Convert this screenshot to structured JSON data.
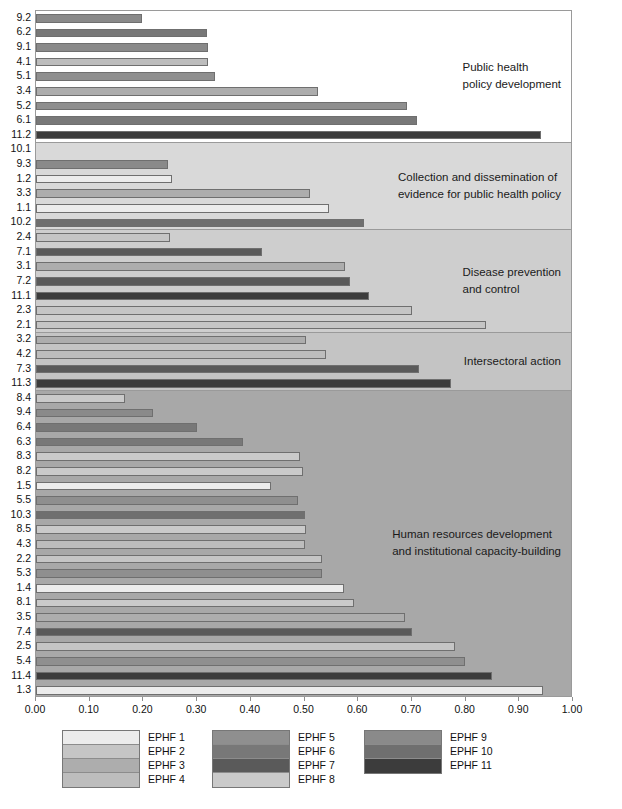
{
  "chart_data": {
    "type": "bar",
    "orientation": "horizontal",
    "title": "",
    "xlabel": "",
    "ylabel": "",
    "xlim": [
      0.0,
      1.0
    ],
    "xticks": [
      "0.00",
      "0.10",
      "0.20",
      "0.30",
      "0.40",
      "0.50",
      "0.60",
      "0.70",
      "0.80",
      "0.90",
      "1.00"
    ],
    "grid": false,
    "legend_position": "bottom",
    "sections": [
      {
        "label": "Public health\npolicy development",
        "background": "#ffffff",
        "bars": [
          {
            "category": "9.2",
            "value": 0.197,
            "series": "EPHF 9"
          },
          {
            "category": "6.2",
            "value": 0.318,
            "series": "EPHF 6"
          },
          {
            "category": "9.1",
            "value": 0.321,
            "series": "EPHF 9"
          },
          {
            "category": "4.1",
            "value": 0.32,
            "series": "EPHF 4"
          },
          {
            "category": "5.1",
            "value": 0.333,
            "series": "EPHF 5"
          },
          {
            "category": "3.4",
            "value": 0.525,
            "series": "EPHF 3"
          },
          {
            "category": "5.2",
            "value": 0.69,
            "series": "EPHF 5"
          },
          {
            "category": "6.1",
            "value": 0.71,
            "series": "EPHF 6"
          },
          {
            "category": "11.2",
            "value": 0.94,
            "series": "EPHF 11"
          }
        ]
      },
      {
        "label": "Collection and dissemination of\nevidence for public health policy",
        "background": "#d9d9d9",
        "bars": [
          {
            "category": "10.1",
            "value": 0.0,
            "series": "EPHF 10"
          },
          {
            "category": "9.3",
            "value": 0.245,
            "series": "EPHF 9"
          },
          {
            "category": "1.2",
            "value": 0.253,
            "series": "EPHF 1"
          },
          {
            "category": "3.3",
            "value": 0.51,
            "series": "EPHF 3"
          },
          {
            "category": "1.1",
            "value": 0.545,
            "series": "EPHF 1"
          },
          {
            "category": "10.2",
            "value": 0.61,
            "series": "EPHF 10"
          }
        ]
      },
      {
        "label": "Disease prevention\nand control",
        "background": "#cecece",
        "bars": [
          {
            "category": "2.4",
            "value": 0.25,
            "series": "EPHF 2"
          },
          {
            "category": "7.1",
            "value": 0.42,
            "series": "EPHF 7"
          },
          {
            "category": "3.1",
            "value": 0.575,
            "series": "EPHF 3"
          },
          {
            "category": "7.2",
            "value": 0.585,
            "series": "EPHF 7"
          },
          {
            "category": "11.1",
            "value": 0.62,
            "series": "EPHF 11"
          },
          {
            "category": "2.3",
            "value": 0.7,
            "series": "EPHF 2"
          },
          {
            "category": "2.1",
            "value": 0.838,
            "series": "EPHF 2"
          }
        ]
      },
      {
        "label": "Intersectoral action",
        "background": "#c4c4c4",
        "bars": [
          {
            "category": "3.2",
            "value": 0.503,
            "series": "EPHF 3"
          },
          {
            "category": "4.2",
            "value": 0.54,
            "series": "EPHF 4"
          },
          {
            "category": "7.3",
            "value": 0.713,
            "series": "EPHF 7"
          },
          {
            "category": "11.3",
            "value": 0.772,
            "series": "EPHF 11"
          }
        ]
      },
      {
        "label": "Human resources development\nand institutional capacity-building",
        "background": "#a8a8a8",
        "bars": [
          {
            "category": "8.4",
            "value": 0.165,
            "series": "EPHF 8"
          },
          {
            "category": "9.4",
            "value": 0.218,
            "series": "EPHF 9"
          },
          {
            "category": "6.4",
            "value": 0.3,
            "series": "EPHF 6"
          },
          {
            "category": "6.3",
            "value": 0.385,
            "series": "EPHF 6"
          },
          {
            "category": "8.3",
            "value": 0.492,
            "series": "EPHF 8"
          },
          {
            "category": "8.2",
            "value": 0.497,
            "series": "EPHF 8"
          },
          {
            "category": "1.5",
            "value": 0.438,
            "series": "EPHF 1"
          },
          {
            "category": "5.5",
            "value": 0.488,
            "series": "EPHF 5"
          },
          {
            "category": "10.3",
            "value": 0.5,
            "series": "EPHF 10"
          },
          {
            "category": "8.5",
            "value": 0.502,
            "series": "EPHF 8"
          },
          {
            "category": "4.3",
            "value": 0.5,
            "series": "EPHF 4"
          },
          {
            "category": "2.2",
            "value": 0.532,
            "series": "EPHF 2"
          },
          {
            "category": "5.3",
            "value": 0.533,
            "series": "EPHF 5"
          },
          {
            "category": "1.4",
            "value": 0.573,
            "series": "EPHF 1"
          },
          {
            "category": "8.1",
            "value": 0.593,
            "series": "EPHF 8"
          },
          {
            "category": "3.5",
            "value": 0.688,
            "series": "EPHF 3"
          },
          {
            "category": "7.4",
            "value": 0.7,
            "series": "EPHF 7"
          },
          {
            "category": "2.5",
            "value": 0.78,
            "series": "EPHF 2"
          },
          {
            "category": "5.4",
            "value": 0.798,
            "series": "EPHF 5"
          },
          {
            "category": "11.4",
            "value": 0.85,
            "series": "EPHF 11"
          },
          {
            "category": "1.3",
            "value": 0.945,
            "series": "EPHF 1"
          }
        ]
      }
    ],
    "legend": [
      {
        "label": "EPHF 1",
        "color": "#ececec"
      },
      {
        "label": "EPHF 2",
        "color": "#c5c5c5"
      },
      {
        "label": "EPHF 3",
        "color": "#adadad"
      },
      {
        "label": "EPHF 4",
        "color": "#bdbdbd"
      },
      {
        "label": "EPHF 5",
        "color": "#8f8f8f"
      },
      {
        "label": "EPHF 6",
        "color": "#787878"
      },
      {
        "label": "EPHF 7",
        "color": "#5a5a5a"
      },
      {
        "label": "EPHF 8",
        "color": "#cacaca"
      },
      {
        "label": "EPHF 9",
        "color": "#8a8a8a"
      },
      {
        "label": "EPHF 10",
        "color": "#6f6f6f"
      },
      {
        "label": "EPHF 11",
        "color": "#3c3c3c"
      }
    ],
    "legend_columns": [
      {
        "items": [
          "EPHF 1",
          "EPHF 2",
          "EPHF 3",
          "EPHF 4"
        ]
      },
      {
        "items": [
          "EPHF 5",
          "EPHF 6",
          "EPHF 7",
          "EPHF 8"
        ]
      },
      {
        "items": [
          "EPHF 9",
          "EPHF 10",
          "EPHF 11"
        ]
      }
    ]
  }
}
